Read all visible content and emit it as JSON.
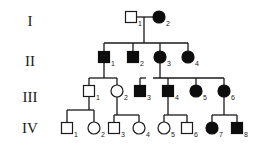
{
  "diagram": {
    "type": "pedigree",
    "generations": [
      {
        "label": "I",
        "y": 21
      },
      {
        "label": "II",
        "y": 61
      },
      {
        "label": "III",
        "y": 97
      },
      {
        "label": "IV",
        "y": 128
      }
    ],
    "individuals": [
      {
        "id": "I-1",
        "num": "1",
        "sex": "male",
        "affected": false,
        "x": 131,
        "y": 17
      },
      {
        "id": "I-2",
        "num": "2",
        "sex": "female",
        "affected": true,
        "x": 159,
        "y": 17
      },
      {
        "id": "II-1",
        "num": "1",
        "sex": "male",
        "affected": true,
        "x": 104,
        "y": 57
      },
      {
        "id": "II-2",
        "num": "2",
        "sex": "male",
        "affected": true,
        "x": 133,
        "y": 57
      },
      {
        "id": "II-3",
        "num": "3",
        "sex": "female",
        "affected": true,
        "x": 160,
        "y": 57
      },
      {
        "id": "II-4",
        "num": "4",
        "sex": "female",
        "affected": true,
        "x": 188,
        "y": 57
      },
      {
        "id": "III-1",
        "num": "1",
        "sex": "male",
        "affected": false,
        "x": 89,
        "y": 91
      },
      {
        "id": "III-2",
        "num": "2",
        "sex": "female",
        "affected": false,
        "x": 117,
        "y": 91
      },
      {
        "id": "III-3",
        "num": "3",
        "sex": "male",
        "affected": true,
        "x": 140,
        "y": 91
      },
      {
        "id": "III-4",
        "num": "4",
        "sex": "male",
        "affected": true,
        "x": 168,
        "y": 91
      },
      {
        "id": "III-5",
        "num": "5",
        "sex": "female",
        "affected": true,
        "x": 196,
        "y": 91
      },
      {
        "id": "III-6",
        "num": "6",
        "sex": "female",
        "affected": true,
        "x": 224,
        "y": 91
      },
      {
        "id": "IV-1",
        "num": "1",
        "sex": "male",
        "affected": false,
        "x": 67,
        "y": 128
      },
      {
        "id": "IV-2",
        "num": "2",
        "sex": "female",
        "affected": false,
        "x": 94,
        "y": 128
      },
      {
        "id": "IV-3",
        "num": "3",
        "sex": "male",
        "affected": false,
        "x": 114,
        "y": 128
      },
      {
        "id": "IV-4",
        "num": "4",
        "sex": "female",
        "affected": false,
        "x": 139,
        "y": 128
      },
      {
        "id": "IV-5",
        "num": "5",
        "sex": "female",
        "affected": false,
        "x": 164,
        "y": 128
      },
      {
        "id": "IV-6",
        "num": "6",
        "sex": "male",
        "affected": false,
        "x": 187,
        "y": 128
      },
      {
        "id": "IV-7",
        "num": "7",
        "sex": "female",
        "affected": true,
        "x": 212,
        "y": 128
      },
      {
        "id": "IV-8",
        "num": "8",
        "sex": "male",
        "affected": true,
        "x": 237,
        "y": 128
      }
    ],
    "lines": [
      [
        136,
        17,
        153,
        17
      ],
      [
        144,
        17,
        144,
        43
      ],
      [
        104,
        43,
        188,
        43
      ],
      [
        104,
        43,
        104,
        51
      ],
      [
        133,
        43,
        133,
        51
      ],
      [
        160,
        43,
        160,
        51
      ],
      [
        188,
        43,
        188,
        51
      ],
      [
        104,
        63,
        104,
        78
      ],
      [
        89,
        78,
        117,
        78
      ],
      [
        89,
        78,
        89,
        85
      ],
      [
        117,
        78,
        117,
        85
      ],
      [
        140,
        78,
        146,
        78
      ],
      [
        140,
        78,
        140,
        85
      ],
      [
        160,
        63,
        160,
        78
      ],
      [
        153,
        78,
        224,
        78
      ],
      [
        168,
        78,
        168,
        85
      ],
      [
        196,
        78,
        196,
        85
      ],
      [
        224,
        78,
        224,
        85
      ],
      [
        89,
        97,
        89,
        110
      ],
      [
        67,
        110,
        94,
        110
      ],
      [
        67,
        110,
        67,
        122
      ],
      [
        94,
        110,
        94,
        122
      ],
      [
        117,
        97,
        117,
        115
      ],
      [
        114,
        115,
        139,
        115
      ],
      [
        114,
        115,
        114,
        122
      ],
      [
        139,
        115,
        139,
        122
      ],
      [
        168,
        97,
        168,
        115
      ],
      [
        164,
        115,
        187,
        115
      ],
      [
        164,
        115,
        164,
        122
      ],
      [
        187,
        115,
        187,
        122
      ],
      [
        224,
        97,
        224,
        115
      ],
      [
        212,
        115,
        237,
        115
      ],
      [
        212,
        115,
        212,
        122
      ],
      [
        237,
        115,
        237,
        122
      ]
    ]
  }
}
